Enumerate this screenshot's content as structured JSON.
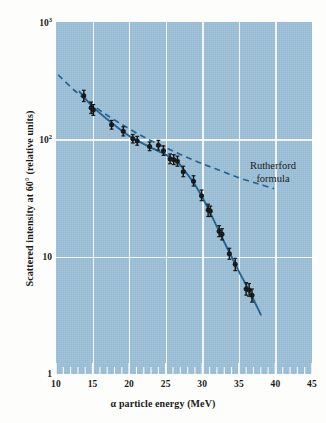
{
  "figure": {
    "kind": "scientific-log-plot",
    "plot_background_color": "#9cc0d8",
    "grid_color": "#ffffff",
    "curve_color": "#1c5f90",
    "marker_color": "#101010"
  },
  "axes": {
    "x": {
      "title": "α particle energy (MeV)",
      "scale": "linear",
      "min": 10,
      "max": 45,
      "major_ticks": [
        10,
        15,
        20,
        25,
        30,
        35,
        40,
        45
      ],
      "major_tick_labels": [
        "10",
        "15",
        "20",
        "25",
        "30",
        "35",
        "40",
        "45"
      ],
      "minor_tick_step": 1,
      "gridlines_at": [
        15,
        20,
        25,
        30,
        35,
        40
      ]
    },
    "y": {
      "title": "Scattered intensity at 60° (relative units)",
      "scale": "log10",
      "min": 1,
      "max": 1000,
      "major_ticks": [
        1,
        10,
        100,
        1000
      ],
      "major_tick_labels": [
        "1",
        "10",
        "10",
        "10"
      ],
      "tick_label_html": [
        "10<sup>3</sup>",
        "10<sup>2</sup>",
        "10",
        "1"
      ],
      "gridlines_at": [
        100,
        10
      ]
    }
  },
  "annotations": [
    {
      "name": "rutherford-formula",
      "line1": "Rutherford",
      "line2": "formula"
    }
  ],
  "chart_data": {
    "type": "scatter",
    "title": "",
    "subtitle": "",
    "xlabel": "α particle energy (MeV)",
    "ylabel": "Scattered intensity at 60° (relative units)",
    "xlim": [
      10,
      45
    ],
    "ylim": [
      1,
      1000
    ],
    "yscale": "log",
    "xscale": "linear",
    "grid": true,
    "legend": "inline-annotation",
    "annotations": [
      "Rutherford formula"
    ],
    "series": [
      {
        "name": "Measured scattered intensity",
        "style": "points-with-error-bars",
        "marker": "filled-circle",
        "color": "#101010",
        "points": [
          {
            "x": 13.8,
            "y": 235,
            "yerr_lo": 210,
            "yerr_hi": 262
          },
          {
            "x": 14.8,
            "y": 186,
            "yerr_lo": 166,
            "yerr_hi": 208
          },
          {
            "x": 15.1,
            "y": 178,
            "yerr_lo": 160,
            "yerr_hi": 198
          },
          {
            "x": 17.6,
            "y": 133,
            "yerr_lo": 122,
            "yerr_hi": 145
          },
          {
            "x": 19.2,
            "y": 117,
            "yerr_lo": 107,
            "yerr_hi": 128
          },
          {
            "x": 20.5,
            "y": 101,
            "yerr_lo": 93,
            "yerr_hi": 110
          },
          {
            "x": 21.1,
            "y": 97,
            "yerr_lo": 89,
            "yerr_hi": 106
          },
          {
            "x": 22.8,
            "y": 87,
            "yerr_lo": 80,
            "yerr_hi": 95
          },
          {
            "x": 24.0,
            "y": 89,
            "yerr_lo": 81,
            "yerr_hi": 98
          },
          {
            "x": 24.7,
            "y": 80,
            "yerr_lo": 73,
            "yerr_hi": 88
          },
          {
            "x": 25.6,
            "y": 68,
            "yerr_lo": 62,
            "yerr_hi": 75
          },
          {
            "x": 26.1,
            "y": 67,
            "yerr_lo": 61,
            "yerr_hi": 74
          },
          {
            "x": 26.6,
            "y": 65,
            "yerr_lo": 59,
            "yerr_hi": 72
          },
          {
            "x": 27.4,
            "y": 53,
            "yerr_lo": 48,
            "yerr_hi": 59
          },
          {
            "x": 28.8,
            "y": 44,
            "yerr_lo": 40,
            "yerr_hi": 49
          },
          {
            "x": 29.9,
            "y": 33,
            "yerr_lo": 30,
            "yerr_hi": 37
          },
          {
            "x": 30.8,
            "y": 25,
            "yerr_lo": 22,
            "yerr_hi": 28
          },
          {
            "x": 31.1,
            "y": 24.5,
            "yerr_lo": 22,
            "yerr_hi": 27
          },
          {
            "x": 32.3,
            "y": 16.5,
            "yerr_lo": 14.8,
            "yerr_hi": 18.4
          },
          {
            "x": 32.7,
            "y": 15.5,
            "yerr_lo": 13.9,
            "yerr_hi": 17.3
          },
          {
            "x": 33.7,
            "y": 10.6,
            "yerr_lo": 9.5,
            "yerr_hi": 11.8
          },
          {
            "x": 34.5,
            "y": 8.6,
            "yerr_lo": 7.6,
            "yerr_hi": 9.7
          },
          {
            "x": 36.0,
            "y": 5.3,
            "yerr_lo": 4.7,
            "yerr_hi": 6.0
          },
          {
            "x": 36.4,
            "y": 5.2,
            "yerr_lo": 4.6,
            "yerr_hi": 5.9
          },
          {
            "x": 36.8,
            "y": 4.7,
            "yerr_lo": 4.1,
            "yerr_hi": 5.3
          }
        ]
      },
      {
        "name": "Experimental fit curve",
        "style": "solid-line",
        "color": "#1c5f90",
        "points": [
          {
            "x": 13.2,
            "y": 255
          },
          {
            "x": 15.0,
            "y": 190
          },
          {
            "x": 17.5,
            "y": 140
          },
          {
            "x": 20.0,
            "y": 107
          },
          {
            "x": 22.5,
            "y": 88
          },
          {
            "x": 25.0,
            "y": 74
          },
          {
            "x": 26.5,
            "y": 65
          },
          {
            "x": 27.5,
            "y": 55
          },
          {
            "x": 29.0,
            "y": 41
          },
          {
            "x": 30.5,
            "y": 28
          },
          {
            "x": 32.0,
            "y": 18
          },
          {
            "x": 33.5,
            "y": 11.5
          },
          {
            "x": 35.0,
            "y": 7.5
          },
          {
            "x": 36.5,
            "y": 5.0
          },
          {
            "x": 38.0,
            "y": 3.2
          }
        ]
      },
      {
        "name": "Rutherford formula",
        "style": "dashed-line",
        "color": "#1c5f90",
        "points": [
          {
            "x": 10.3,
            "y": 355
          },
          {
            "x": 12.5,
            "y": 262
          },
          {
            "x": 15.0,
            "y": 196
          },
          {
            "x": 17.5,
            "y": 153
          },
          {
            "x": 20.0,
            "y": 123
          },
          {
            "x": 22.5,
            "y": 101
          },
          {
            "x": 25.0,
            "y": 85
          },
          {
            "x": 27.5,
            "y": 72
          },
          {
            "x": 30.0,
            "y": 62
          },
          {
            "x": 32.5,
            "y": 54
          },
          {
            "x": 35.0,
            "y": 47
          },
          {
            "x": 37.5,
            "y": 42
          },
          {
            "x": 39.8,
            "y": 38
          }
        ]
      }
    ]
  }
}
